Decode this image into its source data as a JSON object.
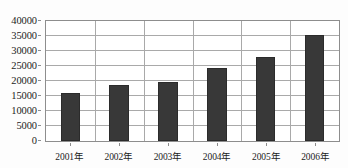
{
  "chart_data": {
    "type": "bar",
    "title": "",
    "xlabel": "",
    "ylabel": "",
    "categories": [
      "2001年",
      "2002年",
      "2003年",
      "2004年",
      "2005年",
      "2006年"
    ],
    "values": [
      16000,
      18700,
      19700,
      24500,
      28000,
      35300
    ],
    "ylim": [
      0,
      40000
    ],
    "ytick_labels": [
      "0",
      "5000",
      "10000",
      "15000",
      "20000",
      "25000",
      "30000",
      "35000",
      "40000"
    ],
    "ytick_values": [
      0,
      5000,
      10000,
      15000,
      20000,
      25000,
      30000,
      35000,
      40000
    ],
    "grid": true,
    "legend": null,
    "bar_color": "#383838",
    "grid_color": "#a9a9a9",
    "frame_color": "#8d8d8d",
    "background_color": "#ffffff"
  }
}
